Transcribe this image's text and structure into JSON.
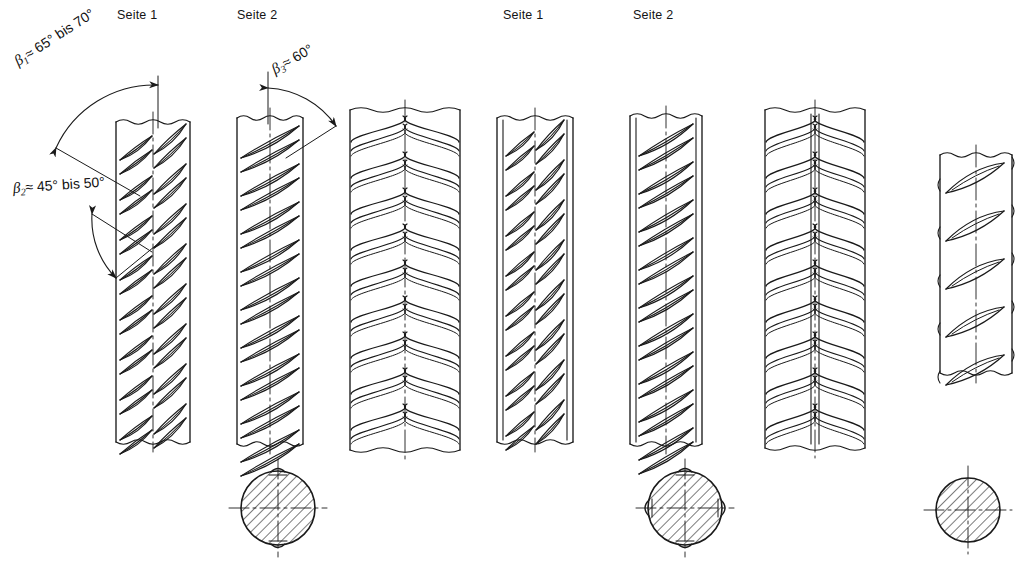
{
  "figure": {
    "kind": "technical-drawing",
    "background_color": "#ffffff",
    "line_color": "#1a1a1a"
  },
  "side_labels": [
    {
      "id": "g1-seite-1",
      "text": "Seite 1",
      "x": 117,
      "y": 8
    },
    {
      "id": "g1-seite-2",
      "text": "Seite 2",
      "x": 237,
      "y": 8
    },
    {
      "id": "g2-seite-1",
      "text": "Seite 1",
      "x": 503,
      "y": 8
    },
    {
      "id": "g2-seite-2",
      "text": "Seite 2",
      "x": 633,
      "y": 8
    }
  ],
  "angles": [
    {
      "id": "beta-1",
      "symbol": "β",
      "subscript": "1",
      "relation": "≈",
      "value": "65° bis 70°",
      "full_text": "β₁ ≈ 65° bis 70°",
      "x": 16,
      "y": 54,
      "rotation": -33
    },
    {
      "id": "beta-2",
      "symbol": "β",
      "subscript": "2",
      "relation": "≈",
      "value": "45° bis 50°",
      "full_text": "β₂ ≈ 45° bis 50°",
      "x": 13,
      "y": 180,
      "rotation": -4
    },
    {
      "id": "beta-3",
      "symbol": "β",
      "subscript": "3",
      "relation": "≈",
      "value": "60°",
      "full_text": "β₃ ≈ 60°",
      "x": 273,
      "y": 62,
      "rotation": -30
    }
  ],
  "bars": [
    {
      "id": "bar-1",
      "name": "flat-view-side-1-two-rib-rows",
      "x": 116,
      "y": 122,
      "w": 74,
      "h": 320,
      "style": "flat",
      "rib_pattern": "double-angle-herringbone",
      "side_ribs": false,
      "center_line": true
    },
    {
      "id": "bar-2",
      "name": "flat-view-side-2-single-rib-row",
      "x": 237,
      "y": 118,
      "w": 66,
      "h": 326,
      "style": "flat",
      "rib_pattern": "single-angle",
      "side_ribs": false,
      "center_line": true
    },
    {
      "id": "bar-3",
      "name": "perspective-view-herringbone",
      "x": 350,
      "y": 110,
      "w": 110,
      "h": 340,
      "style": "round",
      "rib_pattern": "herringbone-3d",
      "side_ribs": false,
      "center_line": true
    },
    {
      "id": "bar-4",
      "name": "flat-view-side-1-with-longitudinal-ribs",
      "x": 497,
      "y": 118,
      "w": 76,
      "h": 324,
      "style": "flat",
      "rib_pattern": "double-angle-herringbone",
      "side_ribs": true,
      "center_line": true
    },
    {
      "id": "bar-5",
      "name": "flat-view-side-2-with-longitudinal-ribs",
      "x": 630,
      "y": 116,
      "w": 72,
      "h": 328,
      "style": "flat",
      "rib_pattern": "single-angle",
      "side_ribs": true,
      "center_line": true
    },
    {
      "id": "bar-6",
      "name": "perspective-view-with-longitudinal-rib",
      "x": 765,
      "y": 110,
      "w": 100,
      "h": 338,
      "style": "round",
      "rib_pattern": "herringbone-3d",
      "side_ribs": true,
      "center_line": true
    },
    {
      "id": "bar-7",
      "name": "perspective-view-sparse-ribs",
      "x": 940,
      "y": 155,
      "w": 72,
      "h": 218,
      "style": "round",
      "rib_pattern": "sparse-diagonal",
      "side_ribs": false,
      "center_line": true
    }
  ],
  "cross_sections": [
    {
      "id": "section-1",
      "name": "cross-section-plain-round",
      "cx": 278,
      "cy": 508,
      "r": 37,
      "hatched": true,
      "rib_nubs": "top-bottom",
      "center_lines": true
    },
    {
      "id": "section-2",
      "name": "cross-section-with-longitudinal-ribs",
      "cx": 685,
      "cy": 508,
      "r": 37,
      "hatched": true,
      "rib_nubs": "four-sides",
      "center_lines": true
    },
    {
      "id": "section-3",
      "name": "cross-section-small-plain",
      "cx": 968,
      "cy": 510,
      "r": 32,
      "hatched": true,
      "rib_nubs": "none",
      "center_lines": true
    }
  ]
}
